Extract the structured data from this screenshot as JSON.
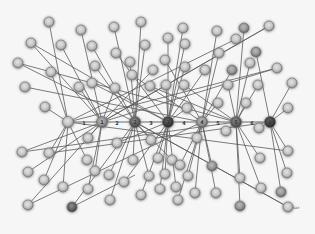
{
  "diagram": {
    "type": "network-graph",
    "colors": {
      "background": "#f6f6f6",
      "edge": "#5a5a5a",
      "node_light": "#c8c8c8",
      "node_mid": "#9a9a9a",
      "node_dark": "#4a4a4a",
      "node_rim": "#6a6a6a"
    },
    "hubs": [
      {
        "id": "h0",
        "x": 68,
        "y": 122,
        "shade": "light"
      },
      {
        "id": "h1",
        "x": 102,
        "y": 122,
        "shade": "mid",
        "label": "1"
      },
      {
        "id": "h2",
        "x": 135,
        "y": 122,
        "shade": "dark",
        "label": "2"
      },
      {
        "id": "h3",
        "x": 168,
        "y": 122,
        "shade": "darker",
        "label": "3"
      },
      {
        "id": "h4",
        "x": 202,
        "y": 122,
        "shade": "mid",
        "label": "4"
      },
      {
        "id": "h5",
        "x": 236,
        "y": 122,
        "shade": "dark",
        "label": "5"
      },
      {
        "id": "h6",
        "x": 270,
        "y": 122,
        "shade": "darker",
        "label": "6"
      }
    ],
    "chain_labels": [
      {
        "text": "1",
        "x": 84,
        "y": 125
      },
      {
        "text": "2",
        "x": 117,
        "y": 125
      },
      {
        "text": "3",
        "x": 151,
        "y": 125
      },
      {
        "text": "4",
        "x": 184,
        "y": 125
      },
      {
        "text": "5",
        "x": 218,
        "y": 125
      },
      {
        "text": "6",
        "x": 252,
        "y": 125
      }
    ],
    "nodes": [
      {
        "x": 49,
        "y": 22,
        "hub": "h0",
        "shade": "light"
      },
      {
        "x": 31,
        "y": 43,
        "hub": "h1",
        "shade": "light"
      },
      {
        "x": 81,
        "y": 30,
        "hub": "h1",
        "shade": "light"
      },
      {
        "x": 61,
        "y": 45,
        "hub": "h1",
        "shade": "light"
      },
      {
        "x": 92,
        "y": 46,
        "hub": "h2",
        "shade": "light"
      },
      {
        "x": 18,
        "y": 63,
        "hub": "h2",
        "shade": "light"
      },
      {
        "x": 51,
        "y": 72,
        "hub": "h0",
        "shade": "light"
      },
      {
        "x": 95,
        "y": 66,
        "hub": "h2",
        "shade": "light"
      },
      {
        "x": 25,
        "y": 87,
        "hub": "h4",
        "shade": "light"
      },
      {
        "x": 79,
        "y": 87,
        "hub": "h1",
        "shade": "light"
      },
      {
        "x": 92,
        "y": 83,
        "hub": "h3",
        "shade": "light"
      },
      {
        "x": 45,
        "y": 107,
        "hub": "h0",
        "shade": "light"
      },
      {
        "x": 115,
        "y": 88,
        "hub": "h1",
        "shade": "light"
      },
      {
        "x": 114,
        "y": 27,
        "hub": "h2",
        "shade": "light"
      },
      {
        "x": 141,
        "y": 22,
        "hub": "h2",
        "shade": "light"
      },
      {
        "x": 116,
        "y": 53,
        "hub": "h3",
        "shade": "light"
      },
      {
        "x": 145,
        "y": 45,
        "hub": "h2",
        "shade": "light"
      },
      {
        "x": 130,
        "y": 62,
        "hub": "h2",
        "shade": "light"
      },
      {
        "x": 132,
        "y": 75,
        "hub": "h4",
        "shade": "light"
      },
      {
        "x": 153,
        "y": 70,
        "hub": "h1",
        "shade": "light"
      },
      {
        "x": 168,
        "y": 38,
        "hub": "h3",
        "shade": "light"
      },
      {
        "x": 183,
        "y": 28,
        "hub": "h3",
        "shade": "light"
      },
      {
        "x": 185,
        "y": 44,
        "hub": "h3",
        "shade": "light"
      },
      {
        "x": 165,
        "y": 60,
        "hub": "h4",
        "shade": "light"
      },
      {
        "x": 185,
        "y": 67,
        "hub": "h3",
        "shade": "light"
      },
      {
        "x": 150,
        "y": 86,
        "hub": "h5",
        "shade": "light"
      },
      {
        "x": 166,
        "y": 85,
        "hub": "h3",
        "shade": "light"
      },
      {
        "x": 184,
        "y": 85,
        "hub": "h5",
        "shade": "light"
      },
      {
        "x": 187,
        "y": 108,
        "hub": "h3",
        "shade": "light"
      },
      {
        "x": 217,
        "y": 31,
        "hub": "h4",
        "shade": "light"
      },
      {
        "x": 244,
        "y": 28,
        "hub": "h5",
        "shade": "mid"
      },
      {
        "x": 236,
        "y": 39,
        "hub": "h0",
        "shade": "light"
      },
      {
        "x": 269,
        "y": 26,
        "hub": "h1",
        "shade": "light"
      },
      {
        "x": 219,
        "y": 53,
        "hub": "h4",
        "shade": "light"
      },
      {
        "x": 256,
        "y": 52,
        "hub": "h6",
        "shade": "mid"
      },
      {
        "x": 232,
        "y": 70,
        "hub": "h4",
        "shade": "mid"
      },
      {
        "x": 205,
        "y": 70,
        "hub": "h3",
        "shade": "light"
      },
      {
        "x": 250,
        "y": 63,
        "hub": "h5",
        "shade": "light"
      },
      {
        "x": 277,
        "y": 68,
        "hub": "h1",
        "shade": "light"
      },
      {
        "x": 228,
        "y": 85,
        "hub": "h5",
        "shade": "light"
      },
      {
        "x": 258,
        "y": 85,
        "hub": "h5",
        "shade": "light"
      },
      {
        "x": 292,
        "y": 83,
        "hub": "h6",
        "shade": "light"
      },
      {
        "x": 218,
        "y": 103,
        "hub": "h4",
        "shade": "light"
      },
      {
        "x": 246,
        "y": 103,
        "hub": "h5",
        "shade": "light"
      },
      {
        "x": 288,
        "y": 108,
        "hub": "h6",
        "shade": "light"
      },
      {
        "x": 22,
        "y": 152,
        "hub": "h1",
        "shade": "light"
      },
      {
        "x": 49,
        "y": 153,
        "hub": "h0",
        "shade": "light"
      },
      {
        "x": 88,
        "y": 138,
        "hub": "h1",
        "shade": "light"
      },
      {
        "x": 117,
        "y": 143,
        "hub": "h3",
        "shade": "light"
      },
      {
        "x": 151,
        "y": 140,
        "hub": "h2",
        "shade": "light"
      },
      {
        "x": 197,
        "y": 138,
        "hub": "h4",
        "shade": "light"
      },
      {
        "x": 226,
        "y": 131,
        "hub": "h5",
        "shade": "light"
      },
      {
        "x": 259,
        "y": 128,
        "hub": "h6",
        "shade": "light"
      },
      {
        "x": 288,
        "y": 151,
        "hub": "h6",
        "shade": "light"
      },
      {
        "x": 28,
        "y": 172,
        "hub": "h1",
        "shade": "light"
      },
      {
        "x": 87,
        "y": 160,
        "hub": "h0",
        "shade": "light"
      },
      {
        "x": 133,
        "y": 160,
        "hub": "h2",
        "shade": "light"
      },
      {
        "x": 158,
        "y": 158,
        "hub": "h3",
        "shade": "light"
      },
      {
        "x": 172,
        "y": 160,
        "hub": "h2",
        "shade": "light"
      },
      {
        "x": 180,
        "y": 165,
        "hub": "h4",
        "shade": "light"
      },
      {
        "x": 212,
        "y": 166,
        "hub": "h4",
        "shade": "mid"
      },
      {
        "x": 260,
        "y": 158,
        "hub": "h5",
        "shade": "light"
      },
      {
        "x": 287,
        "y": 173,
        "hub": "h6",
        "shade": "light"
      },
      {
        "x": 44,
        "y": 180,
        "hub": "h0",
        "shade": "light"
      },
      {
        "x": 95,
        "y": 171,
        "hub": "h1",
        "shade": "light"
      },
      {
        "x": 109,
        "y": 175,
        "hub": "h2",
        "shade": "light"
      },
      {
        "x": 124,
        "y": 182,
        "hub": "h3",
        "shade": "light"
      },
      {
        "x": 149,
        "y": 176,
        "hub": "h2",
        "shade": "light"
      },
      {
        "x": 165,
        "y": 174,
        "hub": "h3",
        "shade": "light"
      },
      {
        "x": 188,
        "y": 176,
        "hub": "h4",
        "shade": "light"
      },
      {
        "x": 240,
        "y": 178,
        "hub": "h5",
        "shade": "light"
      },
      {
        "x": 261,
        "y": 188,
        "hub": "h5",
        "shade": "light"
      },
      {
        "x": 281,
        "y": 192,
        "hub": "h6",
        "shade": "mid"
      },
      {
        "x": 63,
        "y": 187,
        "hub": "h0",
        "shade": "light"
      },
      {
        "x": 88,
        "y": 189,
        "hub": "h1",
        "shade": "light"
      },
      {
        "x": 160,
        "y": 189,
        "hub": "h3",
        "shade": "light"
      },
      {
        "x": 176,
        "y": 187,
        "hub": "h3",
        "shade": "light"
      },
      {
        "x": 195,
        "y": 193,
        "hub": "h4",
        "shade": "light"
      },
      {
        "x": 216,
        "y": 193,
        "hub": "h4",
        "shade": "light"
      },
      {
        "x": 28,
        "y": 205,
        "hub": "h1",
        "shade": "light"
      },
      {
        "x": 72,
        "y": 207,
        "hub": "h2",
        "shade": "dark"
      },
      {
        "x": 110,
        "y": 200,
        "hub": "h2",
        "shade": "light"
      },
      {
        "x": 141,
        "y": 195,
        "hub": "h3",
        "shade": "light"
      },
      {
        "x": 178,
        "y": 200,
        "hub": "h4",
        "shade": "light"
      },
      {
        "x": 240,
        "y": 206,
        "hub": "h5",
        "shade": "mid"
      },
      {
        "x": 288,
        "y": 207,
        "hub": "h2",
        "shade": "light"
      }
    ],
    "extra_edges": [
      {
        "from": [
          18,
          63
        ],
        "to": [
          236,
          122
        ]
      },
      {
        "from": [
          31,
          43
        ],
        "to": [
          168,
          122
        ]
      },
      {
        "from": [
          269,
          26
        ],
        "to": [
          102,
          122
        ]
      },
      {
        "from": [
          277,
          68
        ],
        "to": [
          68,
          122
        ]
      },
      {
        "from": [
          22,
          152
        ],
        "to": [
          236,
          122
        ]
      },
      {
        "from": [
          28,
          205
        ],
        "to": [
          202,
          122
        ]
      },
      {
        "from": [
          72,
          207
        ],
        "to": [
          135,
          175
        ]
      },
      {
        "from": [
          288,
          207
        ],
        "to": [
          135,
          122
        ]
      },
      {
        "from": [
          49,
          153
        ],
        "to": [
          270,
          122
        ]
      },
      {
        "from": [
          288,
          151
        ],
        "to": [
          68,
          122
        ]
      }
    ],
    "corner_mark": {
      "text": "GAP",
      "x": 293,
      "y": 209
    }
  }
}
